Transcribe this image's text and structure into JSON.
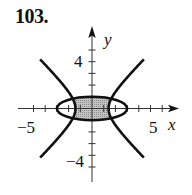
{
  "problem_number": "103.",
  "graph": {
    "x_axis_label": "x",
    "y_axis_label": "y",
    "tick_labels": {
      "x_neg": "−5",
      "x_pos": "5",
      "y_pos": "4",
      "y_neg": "−4"
    },
    "x_range": [
      -6,
      6
    ],
    "y_range": [
      -5,
      5
    ],
    "tick_step": 1,
    "curves": [
      {
        "name": "ellipse",
        "equation": "x^2/9 + y^2 = 1"
      },
      {
        "name": "hyperbola",
        "equation": "x^2 - y^2 = 2"
      }
    ],
    "shaded_region": "inside ellipse, between hyperbola branches",
    "colors": {
      "curve": "#111111",
      "shade": "#b0b0b0",
      "axis": "#333333"
    }
  }
}
